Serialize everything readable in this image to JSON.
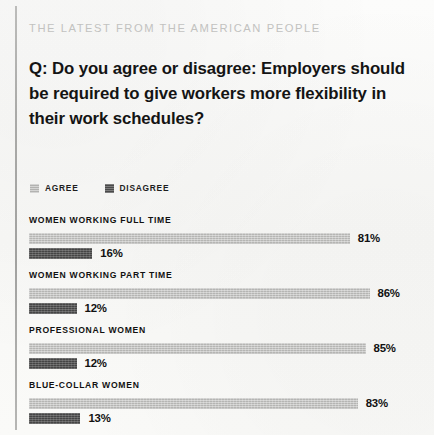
{
  "kicker": "THE LATEST FROM THE AMERICAN PEOPLE",
  "question": "Q: Do you agree or disagree: Employers should be required to give workers more flexibility in their work schedules?",
  "legend": {
    "agree": {
      "label": "AGREE",
      "swatch_icon": "square-swatch-light-icon",
      "color": "#b3b3b1"
    },
    "disagree": {
      "label": "DISAGREE",
      "swatch_icon": "square-swatch-dark-icon",
      "color": "#4a4a4a"
    }
  },
  "chart_data": {
    "type": "bar",
    "title": "Q: Do you agree or disagree: Employers should be required to give workers more flexibility in their work schedules?",
    "subtitle": "THE LATEST FROM THE AMERICAN PEOPLE",
    "orientation": "horizontal",
    "grouped": true,
    "xlabel": "",
    "ylabel": "",
    "xlim": [
      0,
      100
    ],
    "grid": false,
    "legend_position": "top-left",
    "categories": [
      "WOMEN WORKING FULL TIME",
      "WOMEN WORKING PART TIME",
      "PROFESSIONAL WOMEN",
      "BLUE-COLLAR WOMEN"
    ],
    "series": [
      {
        "name": "AGREE",
        "color": "#b3b3b1",
        "values": [
          81,
          86,
          85,
          83
        ],
        "value_labels": [
          "81%",
          "86%",
          "85%",
          "83%"
        ]
      },
      {
        "name": "DISAGREE",
        "color": "#4a4a4a",
        "values": [
          16,
          12,
          12,
          13
        ],
        "value_labels": [
          "16%",
          "12%",
          "12%",
          "13%"
        ]
      }
    ]
  },
  "groups": [
    {
      "label": "WOMEN WORKING FULL TIME",
      "agree": {
        "value": 81,
        "label": "81%",
        "width": "81%"
      },
      "disagree": {
        "value": 16,
        "label": "16%",
        "width": "16%"
      }
    },
    {
      "label": "WOMEN WORKING PART TIME",
      "agree": {
        "value": 86,
        "label": "86%",
        "width": "86%"
      },
      "disagree": {
        "value": 12,
        "label": "12%",
        "width": "12%"
      }
    },
    {
      "label": "PROFESSIONAL WOMEN",
      "agree": {
        "value": 85,
        "label": "85%",
        "width": "85%"
      },
      "disagree": {
        "value": 12,
        "label": "12%",
        "width": "12%"
      }
    },
    {
      "label": "BLUE-COLLAR WOMEN",
      "agree": {
        "value": 83,
        "label": "83%",
        "width": "83%"
      },
      "disagree": {
        "value": 13,
        "label": "13%",
        "width": "13%"
      }
    }
  ]
}
